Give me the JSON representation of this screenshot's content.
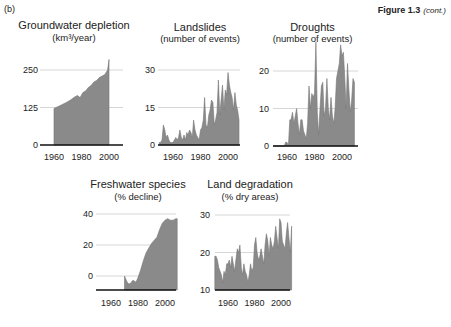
{
  "figure": {
    "panel_label": "(b)",
    "caption_bold": "Figure 1.3",
    "caption_italic": "(cont.)",
    "fill_color": "#8a8a8a",
    "line_color": "#777777",
    "grid_color": "#cccccc",
    "axis_color": "#111111"
  },
  "chart_data": [
    {
      "type": "area",
      "title": "Groundwater depletion",
      "subtitle": "(km³/year)",
      "xlabel": "",
      "ylabel": "",
      "xticks": [
        "1960",
        "1980",
        "2000"
      ],
      "yticks": [
        "0",
        "125",
        "250"
      ],
      "ylim": [
        0,
        280
      ],
      "xlim": [
        1950,
        2010
      ],
      "grid": true,
      "x": [
        1960,
        1963,
        1966,
        1969,
        1972,
        1975,
        1977,
        1979,
        1981,
        1983,
        1985,
        1987,
        1989,
        1991,
        1993,
        1995,
        1997,
        1999,
        2000
      ],
      "values": [
        122,
        128,
        135,
        142,
        150,
        160,
        165,
        158,
        175,
        180,
        192,
        198,
        210,
        215,
        225,
        230,
        235,
        250,
        285
      ]
    },
    {
      "type": "area",
      "title": "Landslides",
      "subtitle": "(number of events)",
      "xticks": [
        "1960",
        "1980",
        "2000"
      ],
      "yticks": [
        "0",
        "15",
        "30"
      ],
      "ylim": [
        0,
        30
      ],
      "xlim": [
        1950,
        2010
      ],
      "grid": true,
      "x": [
        1950,
        1951,
        1952,
        1953,
        1954,
        1955,
        1956,
        1957,
        1958,
        1959,
        1960,
        1961,
        1962,
        1963,
        1964,
        1965,
        1966,
        1967,
        1968,
        1969,
        1970,
        1971,
        1972,
        1973,
        1974,
        1975,
        1976,
        1977,
        1978,
        1979,
        1980,
        1981,
        1982,
        1983,
        1984,
        1985,
        1986,
        1987,
        1988,
        1989,
        1990,
        1991,
        1992,
        1993,
        1994,
        1995,
        1996,
        1997,
        1998,
        1999,
        2000,
        2001,
        2002,
        2003,
        2004,
        2005,
        2006,
        2007,
        2008
      ],
      "values": [
        1,
        1,
        2,
        8,
        6,
        3,
        4,
        2,
        1,
        1,
        1,
        2,
        3,
        2,
        3,
        6,
        3,
        2,
        4,
        2,
        5,
        4,
        6,
        5,
        3,
        10,
        6,
        4,
        3,
        2,
        6,
        7,
        10,
        19,
        8,
        7,
        12,
        14,
        18,
        17,
        8,
        10,
        13,
        26,
        12,
        18,
        24,
        14,
        22,
        20,
        29,
        24,
        21,
        19,
        14,
        21,
        16,
        14,
        10
      ]
    },
    {
      "type": "area",
      "title": "Droughts",
      "subtitle": "(number of events)",
      "xticks": [
        "1960",
        "1980",
        "2000"
      ],
      "yticks": [
        "0",
        "10",
        "20"
      ],
      "ylim": [
        0,
        25
      ],
      "xlim": [
        1950,
        2010
      ],
      "grid": true,
      "x": [
        1950,
        1955,
        1958,
        1959,
        1960,
        1961,
        1962,
        1963,
        1964,
        1965,
        1966,
        1967,
        1968,
        1969,
        1970,
        1971,
        1972,
        1973,
        1974,
        1975,
        1976,
        1977,
        1978,
        1979,
        1980,
        1981,
        1982,
        1983,
        1984,
        1985,
        1986,
        1987,
        1988,
        1989,
        1990,
        1991,
        1992,
        1993,
        1994,
        1995,
        1996,
        1997,
        1998,
        1999,
        2000,
        2001,
        2002,
        2003,
        2004,
        2005,
        2006,
        2007,
        2008,
        2009
      ],
      "values": [
        0,
        0,
        0,
        1,
        1,
        0,
        7,
        7,
        9,
        6,
        8,
        10,
        6,
        3,
        7,
        7,
        4,
        3,
        2,
        6,
        16,
        10,
        14,
        13,
        14,
        31,
        9,
        3,
        10,
        16,
        17,
        8,
        10,
        18,
        10,
        7,
        13,
        8,
        6,
        10,
        18,
        20,
        22,
        27,
        24,
        25,
        18,
        10,
        22,
        15,
        9,
        12,
        18,
        17
      ]
    },
    {
      "type": "area",
      "title": "Freshwater species",
      "subtitle": "(% decline)",
      "xticks": [
        "1960",
        "1980",
        "2000"
      ],
      "yticks": [
        "0",
        "20",
        "40"
      ],
      "ylim": [
        -10,
        45
      ],
      "xlim": [
        1950,
        2010
      ],
      "grid": true,
      "x": [
        1970,
        1971,
        1972,
        1973,
        1974,
        1975,
        1976,
        1977,
        1978,
        1979,
        1980,
        1982,
        1984,
        1986,
        1988,
        1990,
        1992,
        1994,
        1996,
        1998,
        2000,
        2002,
        2004,
        2006,
        2008,
        2009
      ],
      "values": [
        0,
        -2,
        -4,
        -5,
        -5,
        -4,
        -3,
        -3,
        -4,
        -3,
        -1,
        4,
        10,
        15,
        18,
        21,
        23,
        25,
        30,
        34,
        36,
        37,
        36,
        36,
        37,
        37
      ]
    },
    {
      "type": "area",
      "title": "Land degradation",
      "subtitle": "(% dry areas)",
      "xticks": [
        "1960",
        "1980",
        "2000"
      ],
      "yticks": [
        "10",
        "20",
        "30"
      ],
      "ylim": [
        10,
        32
      ],
      "xlim": [
        1950,
        2010
      ],
      "grid": true,
      "x": [
        1950,
        1951,
        1952,
        1953,
        1954,
        1955,
        1956,
        1957,
        1958,
        1959,
        1960,
        1961,
        1962,
        1963,
        1964,
        1965,
        1966,
        1967,
        1968,
        1969,
        1970,
        1971,
        1972,
        1973,
        1974,
        1975,
        1976,
        1977,
        1978,
        1979,
        1980,
        1981,
        1982,
        1983,
        1984,
        1985,
        1986,
        1987,
        1988,
        1989,
        1990,
        1991,
        1992,
        1993,
        1994,
        1995,
        1996,
        1997,
        1998,
        1999,
        2000,
        2001,
        2002,
        2003,
        2004,
        2005,
        2006,
        2007,
        2008
      ],
      "values": [
        19,
        19,
        18,
        16,
        15,
        14,
        12,
        15,
        14,
        17,
        17,
        18,
        16,
        19,
        17,
        15,
        18,
        21,
        20,
        22,
        16,
        14,
        17,
        15,
        14,
        12,
        14,
        17,
        15,
        16,
        22,
        24,
        20,
        18,
        19,
        21,
        19,
        17,
        22,
        25,
        23,
        19,
        24,
        22,
        21,
        23,
        27,
        24,
        21,
        29,
        28,
        23,
        22,
        21,
        25,
        28,
        24,
        20,
        27
      ]
    }
  ]
}
